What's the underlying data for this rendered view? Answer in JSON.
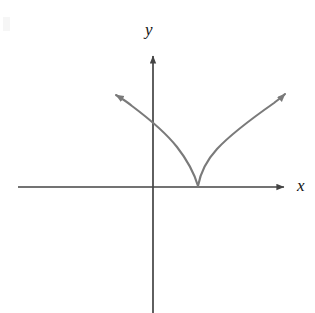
{
  "figure": {
    "background_color": "#ffffff",
    "width": 315,
    "height": 313,
    "axis_color": "#444444",
    "curve_color": "#7a7a7a",
    "label_color": "#111111"
  },
  "labels": {
    "x_axis": "x",
    "y_axis": "y"
  },
  "chart_data": {
    "type": "line",
    "title": "",
    "xlabel": "x",
    "ylabel": "y",
    "grid": false,
    "legend": null,
    "axes": {
      "origin_px": [
        153,
        187
      ],
      "x_axis_start_px": [
        18,
        187
      ],
      "x_axis_arrow_tip_px": [
        292,
        187
      ],
      "y_axis_arrow_tip_px": [
        153,
        48
      ],
      "y_axis_end_px": [
        153,
        313
      ],
      "x_axis_has_arrow": true,
      "y_axis_has_arrow": true,
      "tick_labels_x": [],
      "tick_labels_y": []
    },
    "series": [
      {
        "name": "left-branch",
        "arrow_end": "start",
        "points_px": [
          [
            109,
            92
          ],
          [
            118,
            96
          ],
          [
            128,
            101
          ],
          [
            138,
            107
          ],
          [
            146,
            113
          ],
          [
            153,
            122
          ],
          [
            160,
            128
          ],
          [
            167,
            135
          ],
          [
            174,
            144
          ],
          [
            181,
            153
          ],
          [
            187,
            163
          ],
          [
            192,
            172
          ],
          [
            196,
            180
          ],
          [
            198,
            186
          ]
        ]
      },
      {
        "name": "right-branch",
        "arrow_end": "end",
        "points_px": [
          [
            198,
            186
          ],
          [
            201,
            178
          ],
          [
            205,
            169
          ],
          [
            210,
            160
          ],
          [
            216,
            151
          ],
          [
            223,
            142
          ],
          [
            231,
            134
          ],
          [
            240,
            126
          ],
          [
            250,
            118
          ],
          [
            261,
            110
          ],
          [
            272,
            102
          ],
          [
            282,
            96
          ],
          [
            291,
            90
          ]
        ]
      }
    ],
    "vertex_px": [
      198,
      186
    ],
    "y_axis_crossing_left_branch_px": [
      153,
      122
    ]
  }
}
